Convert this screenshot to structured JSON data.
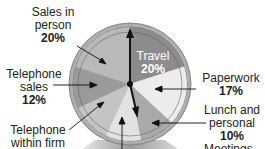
{
  "chart_data": {
    "type": "pie",
    "title": "",
    "style": "clock-face pie chart",
    "start_angle_deg": 0,
    "direction": "clockwise",
    "slices": [
      {
        "label": "Travel",
        "value": 20,
        "color": "#8c8c8c"
      },
      {
        "label": "Paperwork",
        "value": 17,
        "color": "#ececec"
      },
      {
        "label": "Lunch and personal",
        "value": 10,
        "color": "#a9a9a9"
      },
      {
        "label": "Meetings",
        "value": null,
        "color": "#e2e2e2"
      },
      {
        "label": "Telephone within firm",
        "value": null,
        "color": "#c4c4c4"
      },
      {
        "label": "Telephone sales",
        "value": 12,
        "color": "#9a9a9a"
      },
      {
        "label": "Sales in person",
        "value": 20,
        "color": "#b9b9b9"
      }
    ],
    "angles_deg": [
      [
        0,
        72
      ],
      [
        72,
        133
      ],
      [
        133,
        169
      ],
      [
        169,
        205
      ],
      [
        205,
        245
      ],
      [
        245,
        288
      ],
      [
        288,
        360
      ]
    ]
  },
  "labels": {
    "sales_in_person": {
      "line1": "Sales in",
      "line2": "person",
      "pct": "20%"
    },
    "telephone_sales": {
      "line1": "Telephone",
      "line2": "sales",
      "pct": "12%"
    },
    "telephone_within_firm": {
      "line1": "Telephone",
      "line2": "within firm"
    },
    "travel": {
      "line1": "Travel",
      "pct": "20%"
    },
    "paperwork": {
      "line1": "Paperwork",
      "pct": "17%"
    },
    "lunch_personal": {
      "line1": "Lunch and",
      "line2": "personal",
      "pct": "10%"
    },
    "meetings": {
      "line1": "Meetings"
    }
  }
}
